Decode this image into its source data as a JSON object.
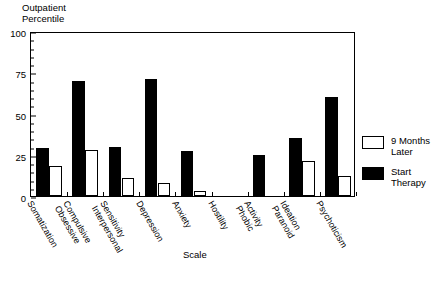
{
  "chart_data": {
    "type": "bar",
    "title": "",
    "ylabel_line1": "Outpatient",
    "ylabel_line2": "Percentile",
    "xlabel": "Scale",
    "ylim": [
      0,
      100
    ],
    "yticks": [
      0,
      25,
      50,
      75,
      100
    ],
    "ytick_labels": [
      "0",
      "25",
      "50",
      "75",
      "100"
    ],
    "yminor_step": 5,
    "grid": false,
    "legend_position": "right",
    "categories": [
      "Somatization",
      "Obsessive Compulsive",
      "Interpersonal Sensitivity",
      "Depression",
      "Anxiety",
      "Hostility",
      "Phobic Activity",
      "Paranoid Ideation",
      "Psychoticism"
    ],
    "category_label_lines": [
      [
        "Somatization",
        ""
      ],
      [
        "Compulsive",
        "Obsessive"
      ],
      [
        "Sensitivity",
        "Interpersonal"
      ],
      [
        "Depression",
        ""
      ],
      [
        "Anxiety",
        ""
      ],
      [
        "Hostility",
        ""
      ],
      [
        "Activity",
        "Phobic"
      ],
      [
        "Ideation",
        "Paranoid"
      ],
      [
        "Psychoticism",
        ""
      ]
    ],
    "series": [
      {
        "name": "Start Therapy",
        "color": "#000000",
        "values": [
          29,
          70,
          30,
          71,
          27,
          0,
          25,
          35,
          60
        ]
      },
      {
        "name": "9 Months Later",
        "color": "#ffffff",
        "values": [
          18,
          28,
          11,
          8,
          3,
          0,
          0,
          21,
          12
        ]
      }
    ]
  },
  "legend": {
    "items": [
      {
        "label_line1": "9 Months",
        "label_line2": "Later",
        "swatch": "hollow"
      },
      {
        "label_line1": "Start",
        "label_line2": "Therapy",
        "swatch": "filled"
      }
    ]
  }
}
